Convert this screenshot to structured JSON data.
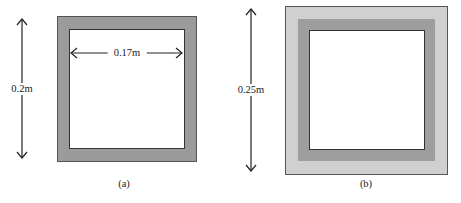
{
  "figure_a": {
    "caption": "(a)",
    "outer_height_label": "0.2m",
    "inner_width_label": "0.17m",
    "colors": {
      "wall": "#9b9b9b",
      "inner": "#ffffff",
      "edge": "#444444"
    }
  },
  "figure_b": {
    "caption": "(b)",
    "outer_height_label": "0.25m",
    "colors": {
      "outer_layer": "#d0d0d0",
      "wall": "#9e9e9e",
      "inner": "#ffffff",
      "edge": "#444444"
    }
  }
}
